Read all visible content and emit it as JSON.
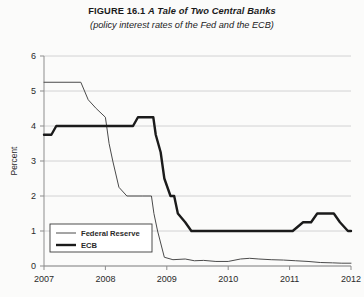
{
  "figure": {
    "title_prefix": "FIGURE 16.1",
    "title_name": "A Tale of Two Central Banks",
    "subtitle": "(policy interest rates of the Fed and the ECB)"
  },
  "axes": {
    "y_axis_title": "Percent",
    "y_ticks": [
      "0",
      "1",
      "2",
      "3",
      "4",
      "5",
      "6"
    ],
    "x_ticks": [
      "2007",
      "2008",
      "2009",
      "2010",
      "2011",
      "2012"
    ]
  },
  "legend": {
    "fed_label": "Federal Reserve",
    "ecb_label": "ECB"
  },
  "colors": {
    "fed_line": "#4a4a4a",
    "ecb_line": "#1b1b1b",
    "gridline": "#c9c9c9",
    "axis": "#8d8d8d",
    "background": "#fbfbfa"
  },
  "chart_data": {
    "type": "line",
    "title": "FIGURE 16.1 A Tale of Two Central Banks",
    "subtitle": "(policy interest rates of the Fed and the ECB)",
    "xlabel": "",
    "ylabel": "Percent",
    "xlim": [
      2007.0,
      2012.0
    ],
    "ylim": [
      0,
      6
    ],
    "y_ticks": [
      0,
      1,
      2,
      3,
      4,
      5,
      6
    ],
    "x_ticks": [
      2007,
      2008,
      2009,
      2010,
      2011,
      2012
    ],
    "grid": "horizontal",
    "legend_position": "lower-left-inside",
    "series": [
      {
        "name": "Federal Reserve",
        "style": "thin",
        "points": [
          [
            2007.0,
            5.25
          ],
          [
            2007.6,
            5.25
          ],
          [
            2007.72,
            4.75
          ],
          [
            2007.85,
            4.5
          ],
          [
            2008.0,
            4.25
          ],
          [
            2008.06,
            3.5
          ],
          [
            2008.12,
            3.0
          ],
          [
            2008.22,
            2.25
          ],
          [
            2008.35,
            2.0
          ],
          [
            2008.6,
            2.0
          ],
          [
            2008.75,
            2.0
          ],
          [
            2008.79,
            1.5
          ],
          [
            2008.85,
            1.0
          ],
          [
            2008.96,
            0.25
          ],
          [
            2009.1,
            0.18
          ],
          [
            2009.3,
            0.2
          ],
          [
            2009.45,
            0.15
          ],
          [
            2009.6,
            0.16
          ],
          [
            2009.8,
            0.13
          ],
          [
            2010.0,
            0.13
          ],
          [
            2010.2,
            0.2
          ],
          [
            2010.35,
            0.22
          ],
          [
            2010.5,
            0.2
          ],
          [
            2010.7,
            0.18
          ],
          [
            2010.9,
            0.17
          ],
          [
            2011.1,
            0.15
          ],
          [
            2011.3,
            0.13
          ],
          [
            2011.5,
            0.1
          ],
          [
            2011.7,
            0.09
          ],
          [
            2011.85,
            0.08
          ],
          [
            2012.0,
            0.08
          ]
        ]
      },
      {
        "name": "ECB",
        "style": "thick",
        "points": [
          [
            2007.0,
            3.75
          ],
          [
            2007.12,
            3.75
          ],
          [
            2007.2,
            4.0
          ],
          [
            2007.3,
            4.0
          ],
          [
            2008.45,
            4.0
          ],
          [
            2008.53,
            4.25
          ],
          [
            2008.78,
            4.25
          ],
          [
            2008.82,
            3.75
          ],
          [
            2008.9,
            3.25
          ],
          [
            2008.96,
            2.5
          ],
          [
            2009.06,
            2.0
          ],
          [
            2009.12,
            2.0
          ],
          [
            2009.18,
            1.5
          ],
          [
            2009.3,
            1.25
          ],
          [
            2009.4,
            1.0
          ],
          [
            2009.5,
            1.0
          ],
          [
            2011.05,
            1.0
          ],
          [
            2011.22,
            1.25
          ],
          [
            2011.35,
            1.25
          ],
          [
            2011.45,
            1.5
          ],
          [
            2011.72,
            1.5
          ],
          [
            2011.82,
            1.25
          ],
          [
            2011.95,
            1.0
          ],
          [
            2012.0,
            1.0
          ]
        ]
      }
    ]
  }
}
